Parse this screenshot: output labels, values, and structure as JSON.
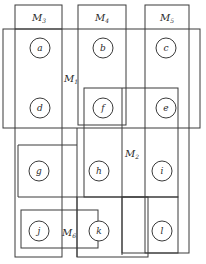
{
  "diagram": {
    "type": "overlapping-module-partition",
    "background": "#ffffff",
    "stroke_color": "#3a3a3a",
    "modules": [
      {
        "id": "M1",
        "base": "M",
        "sub": "1",
        "label_pos": [
          93,
          78
        ]
      },
      {
        "id": "M2",
        "base": "M",
        "sub": "2",
        "label_pos": [
          124,
          153
        ]
      },
      {
        "id": "M3",
        "base": "M",
        "sub": "3",
        "label_pos": [
          32,
          20
        ]
      },
      {
        "id": "M4",
        "base": "M",
        "sub": "4",
        "label_pos": [
          95,
          20
        ]
      },
      {
        "id": "M5",
        "base": "M",
        "sub": "5",
        "label_pos": [
          160,
          20
        ]
      },
      {
        "id": "M6",
        "base": "M",
        "sub": "6",
        "label_pos": [
          61,
          233
        ]
      }
    ],
    "nodes": [
      {
        "id": "a",
        "cx": 40,
        "cy": 48
      },
      {
        "id": "b",
        "cx": 103,
        "cy": 48
      },
      {
        "id": "c",
        "cx": 166,
        "cy": 48
      },
      {
        "id": "d",
        "cx": 40,
        "cy": 108
      },
      {
        "id": "f",
        "cx": 103,
        "cy": 108
      },
      {
        "id": "e",
        "cx": 166,
        "cy": 108
      },
      {
        "id": "g",
        "cx": 39,
        "cy": 171
      },
      {
        "id": "h",
        "cx": 99,
        "cy": 171
      },
      {
        "id": "i",
        "cx": 162,
        "cy": 171
      },
      {
        "id": "j",
        "cx": 39,
        "cy": 231
      },
      {
        "id": "k",
        "cx": 99,
        "cy": 231
      },
      {
        "id": "l",
        "cx": 162,
        "cy": 231
      }
    ]
  }
}
